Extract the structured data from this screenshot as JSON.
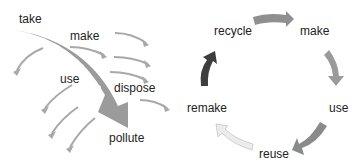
{
  "linear_model": {
    "labels": {
      "take": "take",
      "make": "make",
      "use": "use",
      "dispose": "dispose",
      "pollute": "pollute"
    },
    "colors": {
      "main_arrow": "#9b9b9b",
      "waste_arrows": "#a8a8a8",
      "dots": "#ffffff"
    }
  },
  "circular_model": {
    "labels": {
      "recycle": "recycle",
      "make": "make",
      "use": "use",
      "reuse": "reuse",
      "remake": "remake"
    },
    "colors": {
      "arrow_recycle_make": "#8f8f8f",
      "arrow_make_use": "#9a9a9a",
      "arrow_use_reuse": "#8a8a8a",
      "arrow_reuse_remake": "#e6e6e6",
      "arrow_remake_recycle": "#3e3e3e"
    }
  }
}
